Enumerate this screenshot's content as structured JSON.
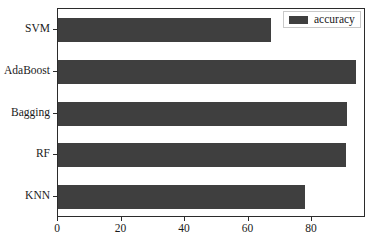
{
  "chart_data": {
    "type": "bar",
    "orientation": "horizontal",
    "title": "",
    "xlabel": "",
    "ylabel": "",
    "categories": [
      "KNN",
      "RF",
      "Bagging",
      "AdaBoost",
      "SVM"
    ],
    "values": [
      77.8,
      90.7,
      91.0,
      93.9,
      67.1
    ],
    "series": [
      {
        "name": "accuracy",
        "values": [
          77.8,
          90.7,
          91.0,
          93.9,
          67.1
        ],
        "color": "#3f3f3f"
      }
    ],
    "xlim": [
      0,
      97
    ],
    "xticks": [
      0,
      20,
      40,
      60,
      80
    ],
    "xticklabels": [
      "0",
      "20",
      "40",
      "60",
      "80"
    ],
    "yticklabels_top_to_bottom": [
      "SVM",
      "AdaBoost",
      "Bagging",
      "RF",
      "KNN"
    ],
    "grid": false,
    "legend": {
      "position": "upper right",
      "entries": [
        {
          "label": "accuracy",
          "color": "#3f3f3f"
        }
      ]
    }
  },
  "legend": {
    "label": "accuracy"
  },
  "axes": {
    "x_tick_labels": [
      "0",
      "20",
      "40",
      "60",
      "80"
    ],
    "y_tick_labels": [
      "SVM",
      "AdaBoost",
      "Bagging",
      "RF",
      "KNN"
    ]
  },
  "colors": {
    "bar": "#3f3f3f",
    "axis": "#2b2b2b",
    "background": "#ffffff",
    "text": "#1a1a1a"
  }
}
